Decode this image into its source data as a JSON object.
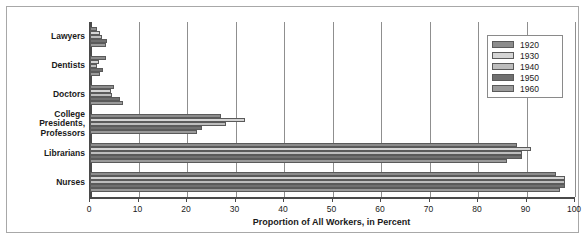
{
  "chart_data": {
    "type": "bar",
    "orientation": "horizontal",
    "title": "",
    "xlabel": "Proportion of All Workers, in Percent",
    "ylabel": "",
    "xlim": [
      0,
      100
    ],
    "xticks": [
      0,
      10,
      20,
      30,
      40,
      50,
      60,
      70,
      80,
      90,
      100
    ],
    "grid": true,
    "grid_axis": "x",
    "legend_position": "top-right",
    "categories": [
      "Lawyers",
      "Dentists",
      "Doctors",
      "College Presidents, Professors",
      "Librarians",
      "Nurses"
    ],
    "series": [
      {
        "name": "1920",
        "color": "#8c8c8c",
        "values": [
          1.4,
          3.2,
          5.0,
          27.0,
          88.0,
          96.0
        ]
      },
      {
        "name": "1930",
        "color": "#d4d4d4",
        "values": [
          2.1,
          1.8,
          4.4,
          32.0,
          91.0,
          98.0
        ]
      },
      {
        "name": "1940",
        "color": "#bdbdbd",
        "values": [
          2.4,
          1.5,
          4.6,
          28.0,
          89.0,
          98.0
        ]
      },
      {
        "name": "1950",
        "color": "#707070",
        "values": [
          3.5,
          2.7,
          6.1,
          23.0,
          89.0,
          98.0
        ]
      },
      {
        "name": "1960",
        "color": "#9a9a9a",
        "values": [
          3.3,
          2.1,
          6.8,
          22.0,
          86.0,
          97.0
        ]
      }
    ]
  },
  "legend": {
    "entries": [
      "1920",
      "1930",
      "1940",
      "1950",
      "1960"
    ]
  },
  "axis": {
    "x_title": "Proportion of All Workers, in Percent",
    "tick_labels": [
      "0",
      "10",
      "20",
      "30",
      "40",
      "50",
      "60",
      "70",
      "80",
      "90",
      "100"
    ]
  },
  "category_labels": [
    "Lawyers",
    "Dentists",
    "Doctors",
    "College\nPresidents,\nProfessors",
    "Librarians",
    "Nurses"
  ]
}
